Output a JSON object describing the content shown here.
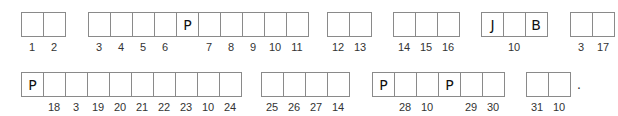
{
  "puzzle": {
    "rows": [
      {
        "words": [
          {
            "cells": [
              {
                "letter": "",
                "number": "1"
              },
              {
                "letter": "",
                "number": "2"
              }
            ]
          },
          {
            "cells": [
              {
                "letter": "",
                "number": "3"
              },
              {
                "letter": "",
                "number": "4"
              },
              {
                "letter": "",
                "number": "5"
              },
              {
                "letter": "",
                "number": "6"
              },
              {
                "letter": "P",
                "number": ""
              },
              {
                "letter": "",
                "number": "7"
              },
              {
                "letter": "",
                "number": "8"
              },
              {
                "letter": "",
                "number": "9"
              },
              {
                "letter": "",
                "number": "10"
              },
              {
                "letter": "",
                "number": "11"
              }
            ]
          },
          {
            "cells": [
              {
                "letter": "",
                "number": "12"
              },
              {
                "letter": "",
                "number": "13"
              }
            ]
          },
          {
            "cells": [
              {
                "letter": "",
                "number": "14"
              },
              {
                "letter": "",
                "number": "15"
              },
              {
                "letter": "",
                "number": "16"
              }
            ]
          },
          {
            "cells": [
              {
                "letter": "J",
                "number": ""
              },
              {
                "letter": "",
                "number": "10"
              },
              {
                "letter": "B",
                "number": ""
              }
            ]
          },
          {
            "cells": [
              {
                "letter": "",
                "number": "3"
              },
              {
                "letter": "",
                "number": "17"
              }
            ]
          }
        ]
      },
      {
        "words": [
          {
            "cells": [
              {
                "letter": "P",
                "number": ""
              },
              {
                "letter": "",
                "number": "18"
              },
              {
                "letter": "",
                "number": "3"
              },
              {
                "letter": "",
                "number": "19"
              },
              {
                "letter": "",
                "number": "20"
              },
              {
                "letter": "",
                "number": "21"
              },
              {
                "letter": "",
                "number": "22"
              },
              {
                "letter": "",
                "number": "23"
              },
              {
                "letter": "",
                "number": "10"
              },
              {
                "letter": "",
                "number": "24"
              }
            ]
          },
          {
            "cells": [
              {
                "letter": "",
                "number": "25"
              },
              {
                "letter": "",
                "number": "26"
              },
              {
                "letter": "",
                "number": "27"
              },
              {
                "letter": "",
                "number": "14"
              }
            ]
          },
          {
            "cells": [
              {
                "letter": "P",
                "number": ""
              },
              {
                "letter": "",
                "number": "28"
              },
              {
                "letter": "",
                "number": "10"
              },
              {
                "letter": "P",
                "number": ""
              },
              {
                "letter": "",
                "number": "29"
              },
              {
                "letter": "",
                "number": "30"
              }
            ]
          },
          {
            "cells": [
              {
                "letter": "",
                "number": "31"
              },
              {
                "letter": "",
                "number": "10"
              }
            ]
          }
        ],
        "end_punctuation": "."
      }
    ]
  }
}
